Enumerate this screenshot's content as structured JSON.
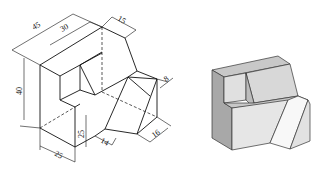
{
  "figure": {
    "line_drawing": {
      "dimensions": {
        "overall_depth": "45",
        "upper_depth": "30",
        "top_width": "15",
        "height": "40",
        "lower_height": "25",
        "front_width": "25",
        "cut_bottom": "14",
        "cut_right": "16",
        "cut_top": "8"
      }
    },
    "shaded_render": {
      "colors": {
        "top": "#c8c8c8",
        "left": "#a8a8a8",
        "front": "#e6e6e6",
        "cut_face": "#f8f8f8",
        "edge": "#333333"
      }
    }
  }
}
